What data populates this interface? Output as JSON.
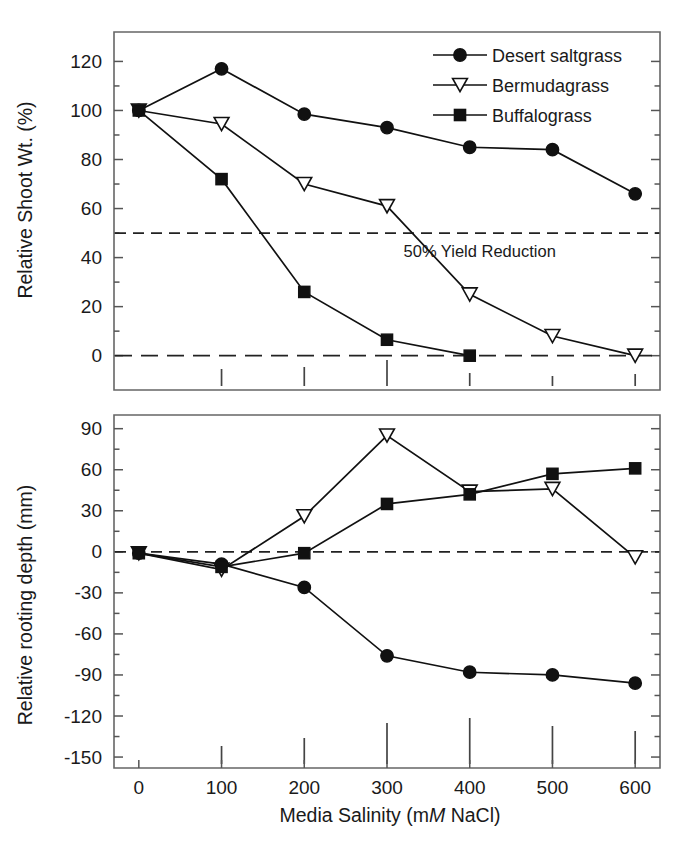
{
  "figure": {
    "xlabel_pre": "Media Salinity (m",
    "xlabel_italic": "M",
    "xlabel_post": " NaCl)"
  },
  "legend": {
    "items": [
      {
        "label": "Desert saltgrass",
        "marker": "circle"
      },
      {
        "label": "Bermudagrass",
        "marker": "triangle-down-open"
      },
      {
        "label": "Buffalograss",
        "marker": "square"
      }
    ]
  },
  "chart_data": [
    {
      "type": "line",
      "panel": "top",
      "title": "",
      "xlabel": "Media Salinity (mM NaCl)",
      "ylabel": "Relative Shoot Wt. (%)",
      "x": [
        0,
        100,
        200,
        300,
        400,
        500,
        600
      ],
      "xlim": [
        -30,
        630
      ],
      "ylim": [
        -14,
        132
      ],
      "yticks": [
        0,
        20,
        40,
        60,
        80,
        100,
        120
      ],
      "ytick_labels": [
        "0",
        "20",
        "40",
        "60",
        "80",
        "100",
        "120"
      ],
      "xticks": [
        0,
        100,
        200,
        300,
        400,
        500,
        600
      ],
      "xtick_labels": [
        "0",
        "100",
        "200",
        "300",
        "400",
        "500",
        "600"
      ],
      "grid": false,
      "legend_position": "top-right",
      "series": [
        {
          "name": "Desert saltgrass",
          "marker": "circle",
          "values": [
            100,
            117,
            98.5,
            93,
            85,
            84,
            66
          ]
        },
        {
          "name": "Bermudagrass",
          "marker": "triangle-down-open",
          "values": [
            100,
            94.5,
            70,
            61,
            25,
            8,
            0
          ]
        },
        {
          "name": "Buffalograss",
          "marker": "square",
          "values": [
            100,
            72,
            26,
            6.5,
            0,
            null,
            null
          ]
        }
      ],
      "reference_lines": [
        {
          "value": 50,
          "style": "dashed",
          "label": "50% Yield Reduction"
        },
        {
          "value": 0,
          "style": "dashed-long",
          "label": ""
        }
      ],
      "error_bars": {
        "note": "LSD bars drawn along baseline",
        "x": [
          100,
          200,
          300,
          400,
          500,
          600
        ],
        "heights": [
          17,
          19,
          26,
          13,
          10,
          12
        ]
      }
    },
    {
      "type": "line",
      "panel": "bottom",
      "title": "",
      "xlabel": "Media Salinity (mM NaCl)",
      "ylabel": "Relative rooting depth (mm)",
      "x": [
        0,
        100,
        200,
        300,
        400,
        500,
        600
      ],
      "xlim": [
        -30,
        630
      ],
      "ylim": [
        -158,
        100
      ],
      "yticks": [
        -150,
        -120,
        -90,
        -60,
        -30,
        0,
        30,
        60,
        90
      ],
      "ytick_labels": [
        "-150",
        "-120",
        "-90",
        "-60",
        "-30",
        "0",
        "30",
        "60",
        "90"
      ],
      "xticks": [
        0,
        100,
        200,
        300,
        400,
        500,
        600
      ],
      "xtick_labels": [
        "0",
        "100",
        "200",
        "300",
        "400",
        "500",
        "600"
      ],
      "grid": false,
      "legend_position": "none",
      "series": [
        {
          "name": "Desert saltgrass",
          "marker": "circle",
          "values": [
            -1,
            -9,
            -26,
            -76,
            -88,
            -90,
            -96
          ]
        },
        {
          "name": "Bermudagrass",
          "marker": "triangle-down-open",
          "values": [
            -1,
            -13,
            26,
            85,
            44,
            46,
            -4
          ]
        },
        {
          "name": "Buffalograss",
          "marker": "square",
          "values": [
            -1,
            -11,
            -1,
            35,
            42,
            57,
            61
          ]
        }
      ],
      "reference_lines": [
        {
          "value": 0,
          "style": "dashed",
          "label": ""
        }
      ],
      "error_bars": {
        "note": "LSD bars drawn along baseline",
        "x": [
          100,
          200,
          300,
          400,
          500,
          600
        ],
        "heights": [
          18,
          26,
          41,
          46,
          38,
          33
        ]
      }
    }
  ],
  "colors": {
    "ink": "#111111",
    "axis": "#555555",
    "background": "#ffffff"
  }
}
